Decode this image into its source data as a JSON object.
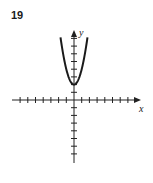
{
  "problem": {
    "number": "19"
  },
  "chart_data": {
    "type": "line",
    "title": "",
    "xlabel": "x",
    "ylabel": "y",
    "function": "y = 2x^2 + 2 (approximate)",
    "vertex": [
      0,
      2
    ],
    "x": [
      -1.75,
      -1.5,
      -1.25,
      -1.0,
      -0.75,
      -0.5,
      -0.25,
      0,
      0.25,
      0.5,
      0.75,
      1.0,
      1.25,
      1.5,
      1.75
    ],
    "y": [
      8.1,
      6.5,
      5.1,
      4.0,
      3.1,
      2.5,
      2.1,
      2.0,
      2.1,
      2.5,
      3.1,
      4.0,
      5.1,
      6.5,
      8.1
    ],
    "xlim": [
      -8,
      8.5
    ],
    "ylim": [
      -8.5,
      9
    ],
    "x_ticks": [
      -7,
      -6,
      -5,
      -4,
      -3,
      -2,
      -1,
      1,
      2,
      3,
      4,
      5,
      6,
      7
    ],
    "y_ticks": [
      -7,
      -6,
      -5,
      -4,
      -3,
      -2,
      -1,
      1,
      2,
      3,
      4,
      5,
      6,
      7,
      8
    ],
    "grid": false,
    "tick_labels_shown": false
  },
  "colors": {
    "curve": "#1a1a1a",
    "axes": "#222222"
  }
}
